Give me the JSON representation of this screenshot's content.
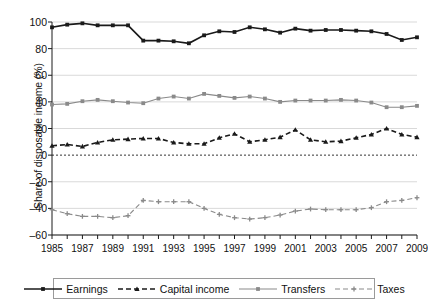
{
  "chart_data": {
    "type": "line",
    "title": "",
    "xlabel": "",
    "ylabel": "Share of disposable income (%)",
    "x": [
      1985,
      1986,
      1987,
      1988,
      1989,
      1990,
      1991,
      1992,
      1993,
      1994,
      1995,
      1996,
      1997,
      1998,
      1999,
      2000,
      2001,
      2002,
      2003,
      2004,
      2005,
      2006,
      2007,
      2008,
      2009
    ],
    "xlim": [
      1985,
      2009
    ],
    "ylim": [
      -60,
      100
    ],
    "yticks": [
      -60,
      -40,
      -20,
      0,
      20,
      40,
      60,
      80,
      100
    ],
    "xticks_labeled": [
      1985,
      1987,
      1989,
      1991,
      1993,
      1995,
      1997,
      1999,
      2001,
      2003,
      2005,
      2007,
      2009
    ],
    "grid": "horizontal",
    "zero_line": true,
    "legend_position": "bottom",
    "series": [
      {
        "name": "Earnings",
        "color": "#1a1a1a",
        "style": "solid",
        "marker": "square",
        "values": [
          96,
          98,
          99,
          97.5,
          97.5,
          97.5,
          86,
          86,
          85.5,
          84,
          90,
          93,
          92.5,
          96,
          94.5,
          92,
          95,
          93.5,
          94,
          94,
          93.5,
          93,
          91,
          86.5,
          88.5
        ]
      },
      {
        "name": "Capital income",
        "color": "#1a1a1a",
        "style": "dashed",
        "marker": "triangle",
        "values": [
          7,
          8,
          6.5,
          9.5,
          11.5,
          12,
          12.5,
          12.5,
          9.5,
          8.5,
          8.5,
          13,
          16,
          10,
          11.5,
          13.5,
          19,
          11.5,
          10,
          10.5,
          13,
          15.5,
          20,
          15.5,
          13.5
        ]
      },
      {
        "name": "Transfers",
        "color": "#8a8a8a",
        "style": "solid",
        "marker": "square",
        "values": [
          38,
          38.5,
          40.5,
          41.5,
          40.5,
          39.5,
          39,
          42.5,
          44,
          42.5,
          46,
          44.5,
          43,
          44,
          42.5,
          40,
          41,
          41,
          41,
          41.5,
          41,
          39.5,
          36,
          36,
          37
        ]
      },
      {
        "name": "Taxes",
        "color": "#8a8a8a",
        "style": "dashed",
        "marker": "plus",
        "values": [
          -41,
          -44,
          -46,
          -46,
          -47,
          -45.5,
          -34,
          -35,
          -35,
          -35,
          -40,
          -44.5,
          -47,
          -48,
          -47,
          -45,
          -42,
          -40.5,
          -41,
          -41,
          -41,
          -39.5,
          -35,
          -34,
          -32
        ]
      }
    ]
  }
}
